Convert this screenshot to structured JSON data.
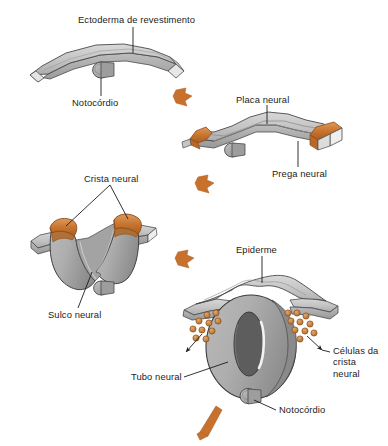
{
  "figure": {
    "language": "pt-BR",
    "background_color": "#ffffff",
    "colors": {
      "tissue_light": "#cfcfcf",
      "tissue_mid": "#b4b4b4",
      "tissue_dark": "#9a9a9a",
      "tissue_edge_white": "#f2f2f2",
      "lumen_dark": "#5d5d5d",
      "crest_orange": "#c8752f",
      "crest_orange_light": "#dd9a5c",
      "crest_orange_dark": "#a85c22",
      "arrow_orange": "#c8712c",
      "outline": "#3a3a3a",
      "leader_line": "#222222",
      "text": "#1c1c1c"
    }
  },
  "stages": [
    {
      "id": "stage-1",
      "name": "ectoderm-stage",
      "order": 1,
      "labels": [
        "Ectoderma de revestimento",
        "Notocórdio"
      ]
    },
    {
      "id": "stage-2",
      "name": "neural-plate-stage",
      "order": 2,
      "labels": [
        "Placa neural",
        "Prega neural"
      ]
    },
    {
      "id": "stage-3",
      "name": "neural-groove-stage",
      "order": 3,
      "labels": [
        "Crista neural",
        "Sulco neural"
      ]
    },
    {
      "id": "stage-4",
      "name": "neural-tube-stage",
      "order": 4,
      "labels": [
        "Epiderme",
        "Tubo neural",
        "Células da\ncrista\nneural",
        "Notocórdio"
      ]
    }
  ],
  "labels": {
    "ectoderma": "Ectoderma de revestimento",
    "notocordio_1": "Notocórdio",
    "placa_neural": "Placa neural",
    "prega_neural": "Prega neural",
    "crista_neural": "Crista neural",
    "sulco_neural": "Sulco neural",
    "epiderme": "Epiderme",
    "tubo_neural": "Tubo neural",
    "celulas_crista": "Células da\ncrista\nneural",
    "notocordio_2": "Notocórdio"
  },
  "arrows": [
    {
      "name": "transition-arrow-1",
      "from": "stage-1",
      "to": "stage-2"
    },
    {
      "name": "transition-arrow-2",
      "from": "stage-2",
      "to": "stage-3"
    },
    {
      "name": "transition-arrow-3",
      "from": "stage-3",
      "to": "stage-4"
    },
    {
      "name": "transition-arrow-4",
      "from": "stage-4",
      "to": "next"
    }
  ]
}
